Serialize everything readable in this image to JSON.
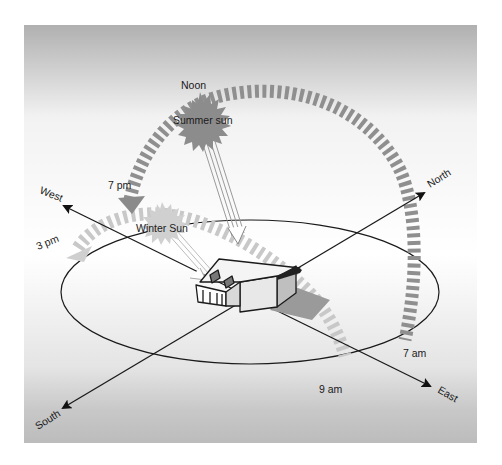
{
  "diagram": {
    "labels": {
      "noon": "Noon",
      "summer_sun": "Summer sun",
      "winter_sun": "Winter Sun",
      "seven_pm": "7 pm",
      "three_pm": "3 pm",
      "seven_am": "7 am",
      "nine_am": "9 am"
    },
    "directions": {
      "north": "North",
      "south": "South",
      "east": "East",
      "west": "West"
    },
    "colors": {
      "summer_path": "#8c8c8c",
      "winter_path": "#c8c8c8",
      "summer_sun": "#8a8a8a",
      "winter_sun": "#cfcfcf",
      "axis": "#222222",
      "panel_top": "#b4b4b4",
      "panel_mid": "#ffffff",
      "panel_bottom": "#bdbdbd"
    }
  }
}
